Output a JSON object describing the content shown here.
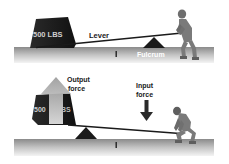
{
  "diagram": {
    "colors": {
      "background": "#ffffff",
      "ground_top": "#8c8c8c",
      "ground_bottom": "#f2f2f2",
      "weight": "#1a1a1a",
      "weight_text": "#d8d8d8",
      "fulcrum": "#1a1a1a",
      "lever": "#1a1a1a",
      "person": "#7a7a7a",
      "arrow_up": "#bdbdbd",
      "arrow_down": "#2a2a2a",
      "label_text": "#1a1a1a",
      "fulcrum_label": "#ffffff"
    },
    "top_panel": {
      "weight_label": "500 LBS",
      "lever_label": "Lever",
      "fulcrum_label": "Fulcrum"
    },
    "bottom_panel": {
      "weight_label_left": "500",
      "weight_label_right": "BS",
      "output_label_line1": "Output",
      "output_label_line2": "force",
      "input_label_line1": "Input",
      "input_label_line2": "force"
    }
  }
}
